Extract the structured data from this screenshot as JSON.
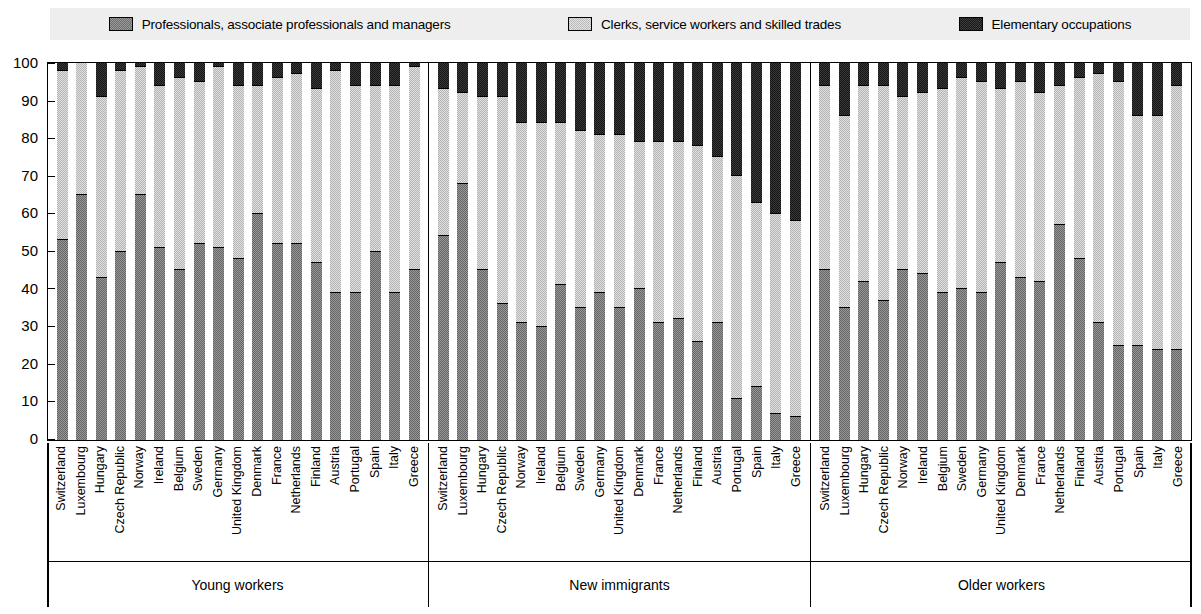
{
  "legend": {
    "items": [
      {
        "key": "prof",
        "label": "Professionals, associate professionals and managers",
        "icon": "legend-swatch-professionals",
        "color": "#9a9a9a"
      },
      {
        "key": "clerk",
        "label": "Clerks, service workers and skilled trades",
        "icon": "legend-swatch-clerks",
        "color": "#e2e2e2"
      },
      {
        "key": "elem",
        "label": "Elementary occupations",
        "icon": "legend-swatch-elementary",
        "color": "#3c3c3c"
      }
    ]
  },
  "axis": {
    "y_ticks": [
      "100",
      "90",
      "80",
      "70",
      "60",
      "50",
      "40",
      "30",
      "20",
      "10",
      "0"
    ]
  },
  "chart_data": {
    "type": "bar",
    "subtype": "stacked-100-percent",
    "title": "",
    "xlabel": "",
    "ylabel": "",
    "ylim": [
      0,
      100
    ],
    "grid": false,
    "legend_position": "top",
    "series_names": [
      "Professionals, associate professionals and managers",
      "Clerks, service workers and skilled trades",
      "Elementary occupations"
    ],
    "categories": [
      "Switzerland",
      "Luxembourg",
      "Hungary",
      "Czech Republic",
      "Norway",
      "Ireland",
      "Belgium",
      "Sweden",
      "Germany",
      "United Kingdom",
      "Denmark",
      "France",
      "Netherlands",
      "Finland",
      "Austria",
      "Portugal",
      "Spain",
      "Italy",
      "Greece"
    ],
    "panels": [
      {
        "name": "Young workers",
        "bars": [
          {
            "country": "Switzerland",
            "prof": 53,
            "clerk": 45,
            "elem": 2
          },
          {
            "country": "Luxembourg",
            "prof": 65,
            "clerk": 35,
            "elem": 0
          },
          {
            "country": "Hungary",
            "prof": 43,
            "clerk": 48,
            "elem": 9
          },
          {
            "country": "Czech Republic",
            "prof": 50,
            "clerk": 48,
            "elem": 2
          },
          {
            "country": "Norway",
            "prof": 65,
            "clerk": 34,
            "elem": 1
          },
          {
            "country": "Ireland",
            "prof": 51,
            "clerk": 43,
            "elem": 6
          },
          {
            "country": "Belgium",
            "prof": 45,
            "clerk": 51,
            "elem": 4
          },
          {
            "country": "Sweden",
            "prof": 52,
            "clerk": 43,
            "elem": 5
          },
          {
            "country": "Germany",
            "prof": 51,
            "clerk": 48,
            "elem": 1
          },
          {
            "country": "United Kingdom",
            "prof": 48,
            "clerk": 46,
            "elem": 6
          },
          {
            "country": "Denmark",
            "prof": 60,
            "clerk": 34,
            "elem": 6
          },
          {
            "country": "France",
            "prof": 52,
            "clerk": 44,
            "elem": 4
          },
          {
            "country": "Netherlands",
            "prof": 52,
            "clerk": 45,
            "elem": 3
          },
          {
            "country": "Finland",
            "prof": 47,
            "clerk": 46,
            "elem": 7
          },
          {
            "country": "Austria",
            "prof": 39,
            "clerk": 59,
            "elem": 2
          },
          {
            "country": "Portugal",
            "prof": 39,
            "clerk": 55,
            "elem": 6
          },
          {
            "country": "Spain",
            "prof": 50,
            "clerk": 44,
            "elem": 6
          },
          {
            "country": "Italy",
            "prof": 39,
            "clerk": 55,
            "elem": 6
          },
          {
            "country": "Greece",
            "prof": 45,
            "clerk": 54,
            "elem": 1
          }
        ]
      },
      {
        "name": "New immigrants",
        "bars": [
          {
            "country": "Switzerland",
            "prof": 54,
            "clerk": 39,
            "elem": 7
          },
          {
            "country": "Luxembourg",
            "prof": 68,
            "clerk": 24,
            "elem": 8
          },
          {
            "country": "Hungary",
            "prof": 45,
            "clerk": 46,
            "elem": 9
          },
          {
            "country": "Czech Republic",
            "prof": 36,
            "clerk": 55,
            "elem": 9
          },
          {
            "country": "Norway",
            "prof": 31,
            "clerk": 53,
            "elem": 16
          },
          {
            "country": "Ireland",
            "prof": 30,
            "clerk": 54,
            "elem": 16
          },
          {
            "country": "Belgium",
            "prof": 41,
            "clerk": 43,
            "elem": 16
          },
          {
            "country": "Sweden",
            "prof": 35,
            "clerk": 47,
            "elem": 18
          },
          {
            "country": "Germany",
            "prof": 39,
            "clerk": 42,
            "elem": 19
          },
          {
            "country": "United Kingdom",
            "prof": 35,
            "clerk": 46,
            "elem": 19
          },
          {
            "country": "Denmark",
            "prof": 40,
            "clerk": 39,
            "elem": 21
          },
          {
            "country": "France",
            "prof": 31,
            "clerk": 48,
            "elem": 21
          },
          {
            "country": "Netherlands",
            "prof": 32,
            "clerk": 47,
            "elem": 21
          },
          {
            "country": "Finland",
            "prof": 26,
            "clerk": 52,
            "elem": 22
          },
          {
            "country": "Austria",
            "prof": 31,
            "clerk": 44,
            "elem": 25
          },
          {
            "country": "Portugal",
            "prof": 11,
            "clerk": 59,
            "elem": 30
          },
          {
            "country": "Spain",
            "prof": 14,
            "clerk": 49,
            "elem": 37
          },
          {
            "country": "Italy",
            "prof": 7,
            "clerk": 53,
            "elem": 40
          },
          {
            "country": "Greece",
            "prof": 6,
            "clerk": 52,
            "elem": 42
          }
        ]
      },
      {
        "name": "Older workers",
        "bars": [
          {
            "country": "Switzerland",
            "prof": 45,
            "clerk": 49,
            "elem": 6
          },
          {
            "country": "Luxembourg",
            "prof": 35,
            "clerk": 51,
            "elem": 14
          },
          {
            "country": "Hungary",
            "prof": 42,
            "clerk": 52,
            "elem": 6
          },
          {
            "country": "Czech Republic",
            "prof": 37,
            "clerk": 57,
            "elem": 6
          },
          {
            "country": "Norway",
            "prof": 45,
            "clerk": 46,
            "elem": 9
          },
          {
            "country": "Ireland",
            "prof": 44,
            "clerk": 48,
            "elem": 8
          },
          {
            "country": "Belgium",
            "prof": 39,
            "clerk": 54,
            "elem": 7
          },
          {
            "country": "Sweden",
            "prof": 40,
            "clerk": 56,
            "elem": 4
          },
          {
            "country": "Germany",
            "prof": 39,
            "clerk": 56,
            "elem": 5
          },
          {
            "country": "United Kingdom",
            "prof": 47,
            "clerk": 46,
            "elem": 7
          },
          {
            "country": "Denmark",
            "prof": 43,
            "clerk": 52,
            "elem": 5
          },
          {
            "country": "France",
            "prof": 42,
            "clerk": 50,
            "elem": 8
          },
          {
            "country": "Netherlands",
            "prof": 57,
            "clerk": 37,
            "elem": 6
          },
          {
            "country": "Finland",
            "prof": 48,
            "clerk": 48,
            "elem": 4
          },
          {
            "country": "Austria",
            "prof": 31,
            "clerk": 66,
            "elem": 3
          },
          {
            "country": "Portugal",
            "prof": 25,
            "clerk": 70,
            "elem": 5
          },
          {
            "country": "Spain",
            "prof": 25,
            "clerk": 61,
            "elem": 14
          },
          {
            "country": "Italy",
            "prof": 24,
            "clerk": 62,
            "elem": 14
          },
          {
            "country": "Greece",
            "prof": 24,
            "clerk": 70,
            "elem": 6
          }
        ]
      }
    ]
  }
}
